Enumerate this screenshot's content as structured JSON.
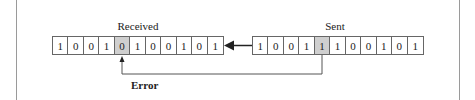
{
  "diagram": {
    "received": {
      "label": "Received",
      "bits": [
        "1",
        "0",
        "0",
        "1",
        "0",
        "1",
        "0",
        "0",
        "1",
        "0",
        "1"
      ],
      "highlight_index": 4
    },
    "sent": {
      "label": "Sent",
      "bits": [
        "1",
        "0",
        "0",
        "1",
        "1",
        "1",
        "0",
        "0",
        "1",
        "0",
        "1"
      ],
      "highlight_index": 4
    },
    "error_label": "Error",
    "highlight_color": "#cfcfcf"
  }
}
